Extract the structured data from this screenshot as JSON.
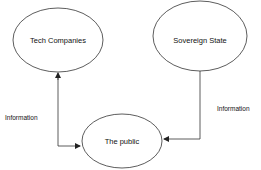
{
  "diagram": {
    "nodes": [
      {
        "id": "tech",
        "label": "Tech Companies",
        "shape": "ellipse"
      },
      {
        "id": "state",
        "label": "Sovereign State",
        "shape": "ellipse"
      },
      {
        "id": "public",
        "label": "The public",
        "shape": "ellipse"
      }
    ],
    "edges": [
      {
        "from": "public",
        "to": "tech",
        "label": "Information",
        "bidirectional": true
      },
      {
        "from": "state",
        "to": "public",
        "label": "Information"
      }
    ],
    "colors": {
      "stroke": "#333333",
      "background": "#ffffff",
      "text": "#111111"
    }
  }
}
